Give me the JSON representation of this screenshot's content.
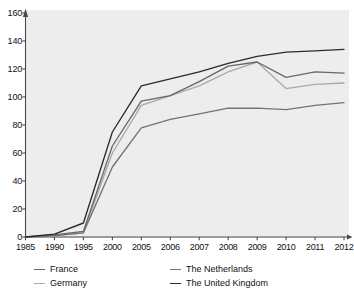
{
  "chart_data": {
    "type": "line",
    "title": "",
    "subtitle": "",
    "xlabel": "",
    "ylabel": "",
    "grid": false,
    "legend_position": "bottom",
    "categories": [
      "1985",
      "1990",
      "1995",
      "2000",
      "2005",
      "2006",
      "2007",
      "2008",
      "2009",
      "2010",
      "2011",
      "2012"
    ],
    "x": [
      "1985",
      "1990",
      "1995",
      "2000",
      "2005",
      "2006",
      "2007",
      "2008",
      "2009",
      "2010",
      "2011",
      "2012"
    ],
    "ylim": [
      0,
      160
    ],
    "ytick_values": [
      0,
      20,
      40,
      60,
      80,
      100,
      120,
      140,
      160
    ],
    "series": [
      {
        "name": "France",
        "color": "#5f6a72",
        "values": [
          0,
          1.5,
          4,
          65,
          97,
          101,
          111,
          122,
          125,
          114,
          118,
          117
        ]
      },
      {
        "name": "Germany",
        "color": "#a8aaab",
        "values": [
          0,
          1,
          3,
          60,
          94,
          101,
          108,
          118,
          125,
          106,
          109,
          110
        ]
      },
      {
        "name": "The Netherlands",
        "color": "#6e7478",
        "values": [
          0,
          1,
          3,
          50,
          78,
          84,
          88,
          92,
          92,
          91,
          94,
          96
        ]
      },
      {
        "name": "The United Kingdom",
        "color": "#2b2b2b",
        "values": [
          0,
          2,
          10,
          75,
          108,
          113,
          118,
          124,
          129,
          132,
          133,
          134
        ]
      }
    ]
  },
  "axes": {
    "y_ticks": [
      "0",
      "20",
      "40",
      "60",
      "80",
      "100",
      "120",
      "140",
      "160"
    ],
    "x_ticks": [
      "1985",
      "1990",
      "1995",
      "2000",
      "2005",
      "2006",
      "2007",
      "2008",
      "2009",
      "2010",
      "2011",
      "2012"
    ]
  },
  "legend": {
    "items": [
      {
        "label": "France",
        "color": "#5f6a72"
      },
      {
        "label": "Germany",
        "color": "#a8aaab"
      },
      {
        "label": "The Netherlands",
        "color": "#6e7478"
      },
      {
        "label": "The United Kingdom",
        "color": "#2b2b2b"
      }
    ]
  },
  "style": {
    "plot_background": "#ededed",
    "page_background": "#ffffff",
    "axis_color": "#4a4a4a",
    "text_color": "#111111"
  }
}
